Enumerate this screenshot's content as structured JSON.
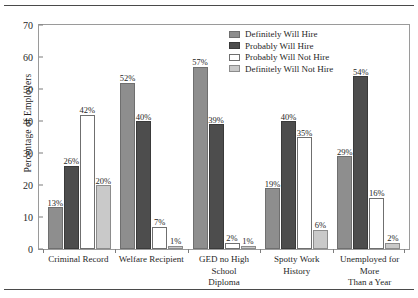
{
  "chart_data": {
    "type": "bar",
    "title": "",
    "subtitle": "",
    "xlabel": "",
    "ylabel": "Percentage of Employers",
    "ylim": [
      0,
      70
    ],
    "ytick_step": 10,
    "yticks": [
      0,
      10,
      20,
      30,
      40,
      50,
      60,
      70
    ],
    "ytick_labels": [
      "0",
      "10",
      "20",
      "30",
      "40",
      "50",
      "60",
      "70"
    ],
    "grid": false,
    "legend_position": "upper right (inside plot)",
    "value_suffix": "%",
    "categories": [
      "Criminal Record",
      "Welfare Recipient",
      "GED no High School Diploma",
      "Spotty Work History",
      "Unemployed for More Than a Year"
    ],
    "series": [
      {
        "name": "Definitely Will Hire",
        "color": "#8e8e8e",
        "values": [
          13,
          52,
          57,
          19,
          29
        ],
        "labels": [
          "13%",
          "52%",
          "57%",
          "19%",
          "29%"
        ]
      },
      {
        "name": "Probably Will Hire",
        "color": "#4d4d4d",
        "values": [
          26,
          40,
          39,
          40,
          54
        ],
        "labels": [
          "26%",
          "40%",
          "39%",
          "40%",
          "54%"
        ]
      },
      {
        "name": "Probably Will Not Hire",
        "color": "#ffffff",
        "values": [
          42,
          7,
          2,
          35,
          16
        ],
        "labels": [
          "42%",
          "7%",
          "2%",
          "35%",
          "16%"
        ]
      },
      {
        "name": "Definitely Will Not Hire",
        "color": "#c9c9c9",
        "values": [
          20,
          1,
          1,
          6,
          2
        ],
        "labels": [
          "20%",
          "1%",
          "1%",
          "6%",
          "2%"
        ]
      }
    ]
  },
  "legend": {
    "items": [
      {
        "label": "Definitely Will Hire"
      },
      {
        "label": "Probably Will Hire"
      },
      {
        "label": "Probably Will Not Hire"
      },
      {
        "label": "Definitely Will Not Hire"
      }
    ]
  },
  "axis": {
    "y_title": "Percentage of Employers"
  },
  "category_label_lines": [
    [
      "Criminal Record"
    ],
    [
      "Welfare Recipient"
    ],
    [
      "GED no High School",
      "Diploma"
    ],
    [
      "Spotty Work",
      "History"
    ],
    [
      "Unemployed for More",
      "Than a Year"
    ]
  ]
}
